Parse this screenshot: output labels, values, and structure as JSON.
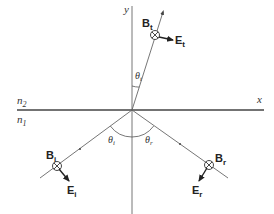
{
  "diagram": {
    "axes": {
      "x_label": "x",
      "y_label": "y"
    },
    "media": {
      "upper": {
        "label": "n",
        "subscript": "2"
      },
      "lower": {
        "label": "n",
        "subscript": "1"
      }
    },
    "transmitted": {
      "B": {
        "label": "B",
        "subscript": "t"
      },
      "E": {
        "label": "E",
        "subscript": "t"
      },
      "angle": {
        "label": "θ",
        "subscript": "t"
      }
    },
    "incident": {
      "B": {
        "label": "B",
        "subscript": "i"
      },
      "E": {
        "label": "E",
        "subscript": "i"
      },
      "angle": {
        "label": "θ",
        "subscript": "i"
      }
    },
    "reflected": {
      "B": {
        "label": "B",
        "subscript": "r"
      },
      "E": {
        "label": "E",
        "subscript": "r"
      },
      "angle": {
        "label": "θ",
        "subscript": "r"
      }
    },
    "colors": {
      "line": "#555555",
      "axis": "#444444",
      "text": "#222222"
    }
  }
}
